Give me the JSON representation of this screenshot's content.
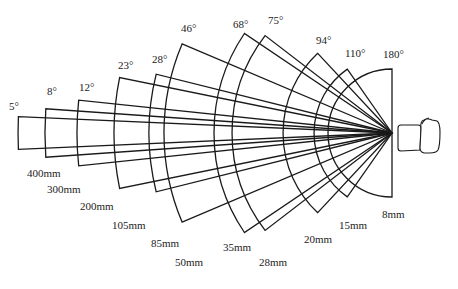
{
  "diagram": {
    "apex": {
      "x": 392,
      "y": 133
    },
    "stroke_color": "#1a1a1a",
    "sectors": [
      {
        "angle_label": "5°",
        "angle": 5,
        "focal_label": "400mm",
        "radius": 374,
        "angle_label_pos": [
          9,
          110
        ],
        "focal_label_pos": [
          27,
          177
        ]
      },
      {
        "angle_label": "8°",
        "angle": 8,
        "focal_label": "300mm",
        "radius": 347,
        "angle_label_pos": [
          47,
          95
        ],
        "focal_label_pos": [
          47,
          193
        ]
      },
      {
        "angle_label": "12°",
        "angle": 12,
        "focal_label": "200mm",
        "radius": 315,
        "angle_label_pos": [
          79,
          91
        ],
        "focal_label_pos": [
          80,
          210
        ]
      },
      {
        "angle_label": "23°",
        "angle": 23,
        "focal_label": "105mm",
        "radius": 278,
        "angle_label_pos": [
          118,
          69
        ],
        "focal_label_pos": [
          112,
          229
        ]
      },
      {
        "angle_label": "28°",
        "angle": 28,
        "focal_label": "85mm",
        "radius": 243,
        "angle_label_pos": [
          152,
          63
        ],
        "focal_label_pos": [
          151,
          247
        ]
      },
      {
        "angle_label": "46°",
        "angle": 46,
        "focal_label": "50mm",
        "radius": 228,
        "angle_label_pos": [
          181,
          32
        ],
        "focal_label_pos": [
          175,
          266
        ]
      },
      {
        "angle_label": "68°",
        "angle": 68,
        "focal_label": "35mm",
        "radius": 178,
        "angle_label_pos": [
          233,
          28
        ],
        "focal_label_pos": [
          223,
          251
        ]
      },
      {
        "angle_label": "75°",
        "angle": 75,
        "focal_label": "28mm",
        "radius": 160,
        "angle_label_pos": [
          268,
          24
        ],
        "focal_label_pos": [
          259,
          266
        ]
      },
      {
        "angle_label": "94°",
        "angle": 94,
        "focal_label": "20mm",
        "radius": 109,
        "angle_label_pos": [
          316,
          44
        ],
        "focal_label_pos": [
          304,
          243
        ]
      },
      {
        "angle_label": "110°",
        "angle": 110,
        "focal_label": "15mm",
        "radius": 78,
        "angle_label_pos": [
          345,
          57
        ],
        "focal_label_pos": [
          339,
          229
        ]
      },
      {
        "angle_label": "180°",
        "angle": 180,
        "focal_label": "8mm",
        "radius": 64,
        "angle_label_pos": [
          383,
          58
        ],
        "focal_label_pos": [
          382,
          218
        ]
      }
    ],
    "camera": {
      "label": "camera-icon"
    }
  }
}
